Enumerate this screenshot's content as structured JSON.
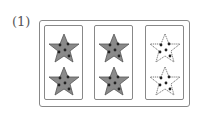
{
  "problem": {
    "label": "(1)",
    "groups": [
      {
        "stars": [
          {
            "shaded": true,
            "dots": 5
          },
          {
            "shaded": true,
            "dots": 5
          }
        ]
      },
      {
        "stars": [
          {
            "shaded": true,
            "dots": 5
          },
          {
            "shaded": true,
            "dots": 5
          }
        ]
      },
      {
        "stars": [
          {
            "shaded": false,
            "dots": 5
          },
          {
            "shaded": false,
            "dots": 5
          }
        ]
      }
    ],
    "colors": {
      "shaded_fill": "#8a8a8a",
      "unshaded_fill": "#ffffff",
      "outline": "#555555",
      "dot": "#222222"
    }
  }
}
